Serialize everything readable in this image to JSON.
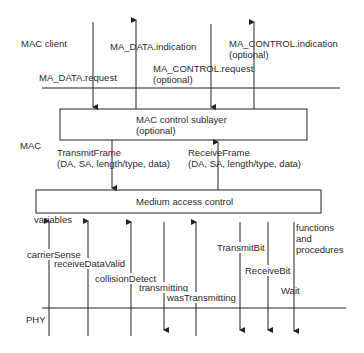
{
  "layers": {
    "mac_client": "MAC client",
    "mac": "MAC",
    "phy": "PHY"
  },
  "boxes": {
    "mac_control": {
      "line1": "MAC control sublayer",
      "line2": "(optional)"
    },
    "medium_access": {
      "label": "Medium access control"
    }
  },
  "primitives": {
    "ma_data_request": "MA_DATA.request",
    "ma_data_indication": "MA_DATA.indication",
    "ma_control_request": {
      "line1": "MA_CONTROL.request",
      "line2": "(optional)"
    },
    "ma_control_indication": {
      "line1": "MA_CONTROL.indication",
      "line2": "(optional)"
    }
  },
  "frames": {
    "transmit": {
      "line1": "TransmitFrame",
      "line2": "(DA, SA, length/type, data)"
    },
    "receive": {
      "line1": "ReceiveFrame",
      "line2": "(DA, SA, length/type, data)"
    }
  },
  "phy_interface": {
    "variables_heading": "variables",
    "functions_heading": {
      "line1": "functions",
      "line2": "and",
      "line3": "procedures"
    },
    "signals": [
      {
        "label": "carrierSense",
        "direction": "up"
      },
      {
        "label": "receiveDataValid",
        "direction": "up"
      },
      {
        "label": "collisionDetect",
        "direction": "up"
      },
      {
        "label": "transmitting",
        "direction": "down"
      },
      {
        "label": "wasTransmitting",
        "direction": "up"
      },
      {
        "label": "TransmitBit",
        "direction": "down"
      },
      {
        "label": "ReceiveBit",
        "direction": "down"
      },
      {
        "label": "Wait",
        "direction": "down"
      }
    ]
  },
  "colors": {
    "line": "#222222",
    "background": "#ffffff"
  }
}
